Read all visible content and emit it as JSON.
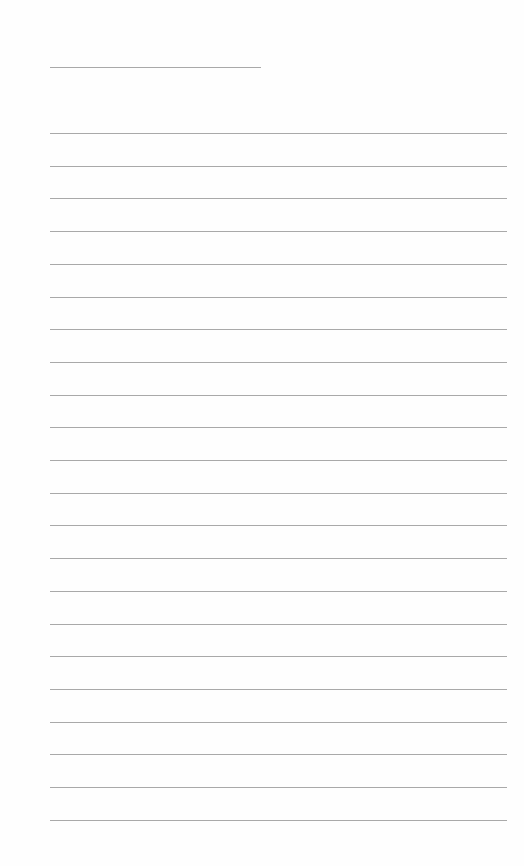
{
  "page": {
    "type": "blank lined paper",
    "header_line": {
      "present": true
    },
    "ruled_lines": {
      "count": 22
    },
    "text_content": ""
  }
}
